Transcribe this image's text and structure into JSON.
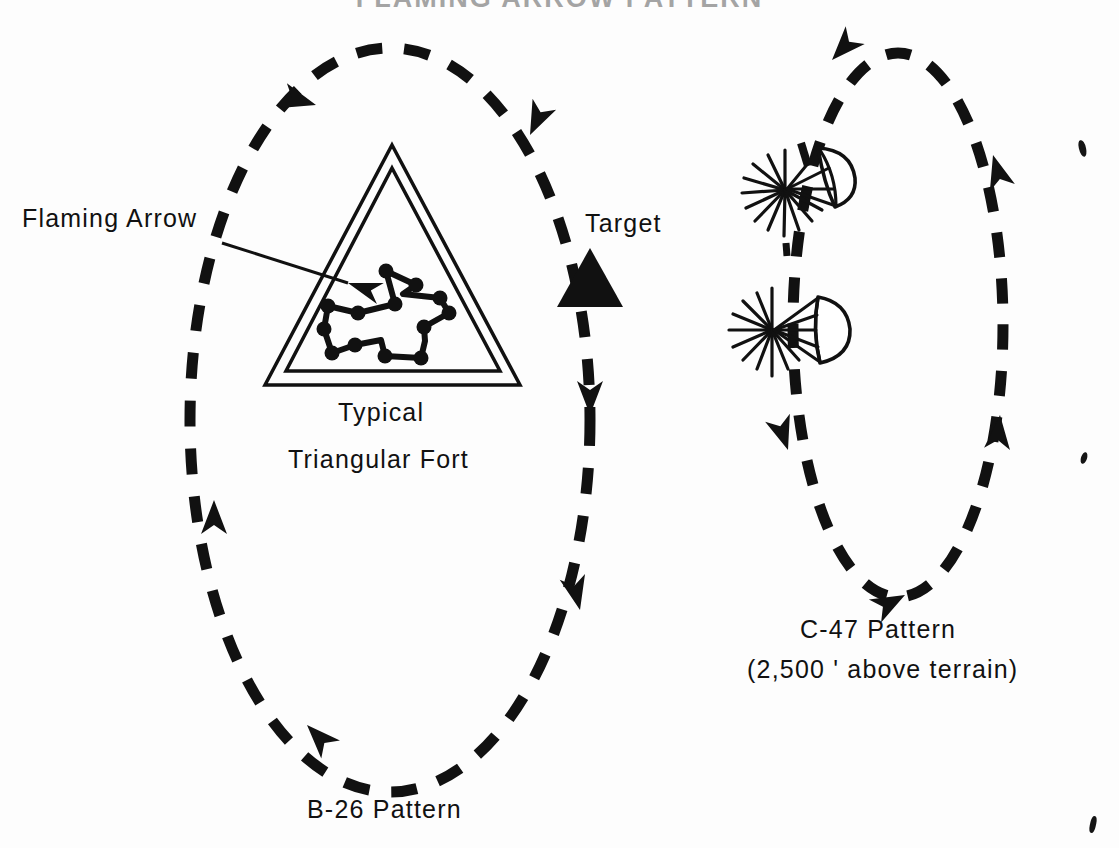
{
  "page": {
    "title_partial": "FLAMING ARROW PATTERN",
    "background_color": "#fdfdfd",
    "ink_color": "#111111",
    "width": 1119,
    "height": 848
  },
  "labels": {
    "flaming_arrow": "Flaming  Arrow",
    "target": "Target",
    "typical": "Typical",
    "triangular_fort": "Triangular  Fort",
    "b26_pattern": "B-26  Pattern",
    "c47_pattern": "C-47  Pattern",
    "c47_altitude": "(2,500 '  above  terrain)"
  },
  "diagram": {
    "type": "tactical-orbit-pattern",
    "left_orbit": {
      "name": "B-26 Pattern",
      "shape": "dashed-ellipse",
      "direction": "counterclockwise",
      "center_x": 390,
      "center_y": 420,
      "radius_x": 200,
      "radius_y": 370,
      "arrowhead_count": 5
    },
    "right_orbit": {
      "name": "C-47 Pattern",
      "shape": "dashed-ellipse",
      "direction": "clockwise",
      "center_x": 898,
      "center_y": 325,
      "radius_x": 105,
      "radius_y": 270,
      "arrowhead_count": 4,
      "altitude_note": "2,500 ' above terrain"
    },
    "target_marker": {
      "label": "Target",
      "shape": "solid-triangle",
      "x": 590,
      "y": 288
    },
    "fort": {
      "label": "Typical Triangular Fort",
      "shape": "double-outline-triangle",
      "apex_x": 392,
      "apex_y": 145,
      "base_y": 385
    },
    "flaming_arrow_marker": {
      "label": "Flaming Arrow",
      "shape": "dotted-arrow-polygon",
      "vertex_count": 12
    },
    "flares": [
      {
        "name": "parachute-flare-upper",
        "x": 795,
        "y": 182,
        "canopy_angle": -38
      },
      {
        "name": "parachute-flare-lower",
        "x": 790,
        "y": 325,
        "canopy_angle": -8
      }
    ]
  }
}
